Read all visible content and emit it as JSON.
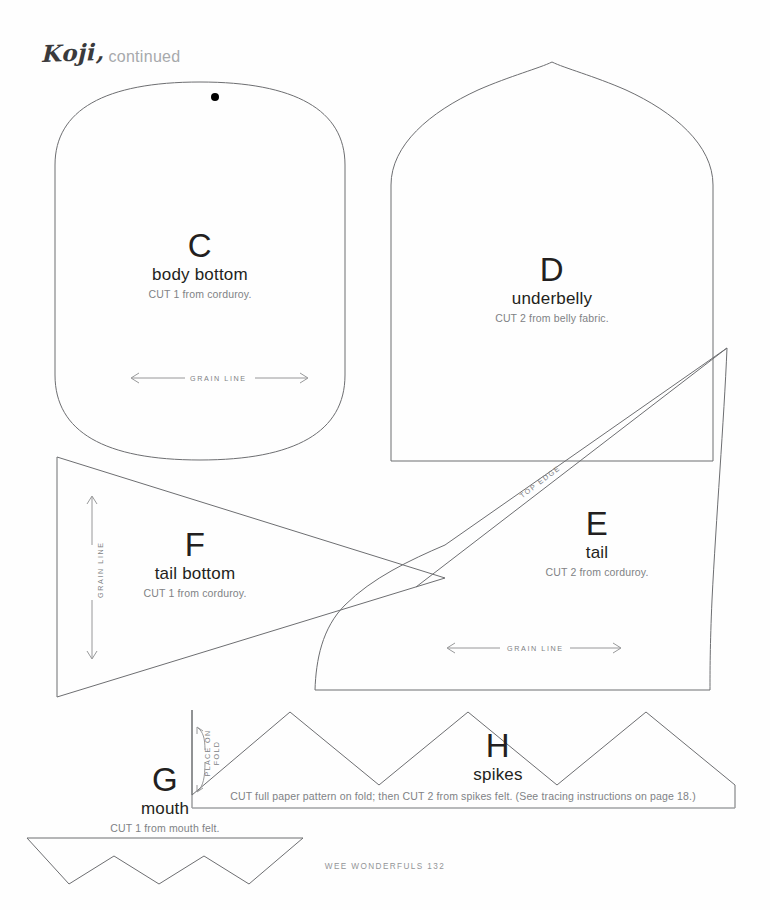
{
  "page": {
    "title_main": "Koji,",
    "title_sub": "continued",
    "footer": "WEE WONDERFULS  132",
    "background_color": "#fefefe",
    "line_color": "#6d6e71",
    "text_color": "#231f20",
    "muted_text_color": "#808285"
  },
  "markers": {
    "grain_line": "GRAIN LINE",
    "top_edge": "TOP EDGE",
    "place_on_fold_line1": "PLACE ON",
    "place_on_fold_line2": "FOLD"
  },
  "pieces": [
    {
      "letter": "C",
      "name": "body bottom",
      "cut": "CUT 1 from corduroy.",
      "shape": "rounded-rectangle",
      "has_dot": true,
      "grain_line": "horizontal"
    },
    {
      "letter": "D",
      "name": "underbelly",
      "cut": "CUT 2 from belly fabric.",
      "shape": "pointed-arch",
      "has_dot": false,
      "grain_line": "none"
    },
    {
      "letter": "E",
      "name": "tail",
      "cut": "CUT 2 from corduroy.",
      "shape": "curved-tail",
      "has_dot": false,
      "grain_line": "horizontal"
    },
    {
      "letter": "F",
      "name": "tail bottom",
      "cut": "CUT 1 from corduroy.",
      "shape": "triangle",
      "has_dot": false,
      "grain_line": "vertical"
    },
    {
      "letter": "G",
      "name": "mouth",
      "cut": "CUT 1 from mouth felt.",
      "shape": "zigzag-strip",
      "has_dot": false,
      "grain_line": "none"
    },
    {
      "letter": "H",
      "name": "spikes",
      "cut": "CUT full paper pattern on fold; then CUT 2 from spikes felt. (See tracing instructions on page 18.)",
      "shape": "sawtooth-peaks",
      "has_dot": false,
      "grain_line": "none"
    }
  ]
}
